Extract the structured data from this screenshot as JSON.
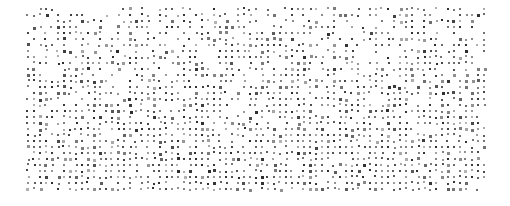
{
  "image": {
    "kind": "dot-matrix-pattern",
    "title": "Halftone Dot Matrix Texture",
    "width": 510,
    "height": 206,
    "background_color": "#ffffff"
  },
  "pattern": {
    "dot_color": "#2b2b2b",
    "dot_shape": "square",
    "dot_size_px": 2,
    "grid_spacing_x_px": 6,
    "grid_spacing_y_px": 6,
    "field_left_px": 27,
    "field_top_px": 8,
    "field_right_px": 485,
    "field_bottom_px": 190,
    "columns": 77,
    "rows": 31,
    "density_description": "sparser and more irregular near the top, denser and more regular toward the bottom",
    "density_top": 0.52,
    "density_bottom": 0.88,
    "jitter_px": 0.7,
    "opacity_min": 0.35,
    "opacity_max": 1.0,
    "random_seed": 20240517
  },
  "chart_data": {
    "type": "heatmap",
    "xlabel": "",
    "ylabel": "",
    "legend": [],
    "annotations": [],
    "grid": true,
    "columns": 77,
    "rows": 31,
    "value_label": "dot presence probability",
    "row_densities": [
      0.5,
      0.52,
      0.54,
      0.55,
      0.57,
      0.58,
      0.6,
      0.61,
      0.63,
      0.64,
      0.66,
      0.67,
      0.69,
      0.7,
      0.72,
      0.73,
      0.75,
      0.76,
      0.78,
      0.79,
      0.81,
      0.82,
      0.84,
      0.85,
      0.86,
      0.87,
      0.88,
      0.89,
      0.88,
      0.86,
      0.8
    ],
    "column_densities": [
      0.72,
      0.78,
      0.7,
      0.82,
      0.66,
      0.8,
      0.74,
      0.62,
      0.84,
      0.7,
      0.76,
      0.68,
      0.8,
      0.72,
      0.64,
      0.86,
      0.7,
      0.78,
      0.74,
      0.66,
      0.82,
      0.7,
      0.76,
      0.6,
      0.84,
      0.72,
      0.68,
      0.8,
      0.74,
      0.78,
      0.64,
      0.86,
      0.7,
      0.72,
      0.82,
      0.66,
      0.76,
      0.7,
      0.8,
      0.62,
      0.84,
      0.74,
      0.68,
      0.78,
      0.72,
      0.66,
      0.86,
      0.7,
      0.8,
      0.74,
      0.64,
      0.82,
      0.76,
      0.7,
      0.6,
      0.84,
      0.72,
      0.78,
      0.68,
      0.8,
      0.74,
      0.66,
      0.86,
      0.7,
      0.76,
      0.82,
      0.64,
      0.72,
      0.78,
      0.7,
      0.8,
      0.66,
      0.84,
      0.74,
      0.68,
      0.76,
      0.6
    ]
  }
}
